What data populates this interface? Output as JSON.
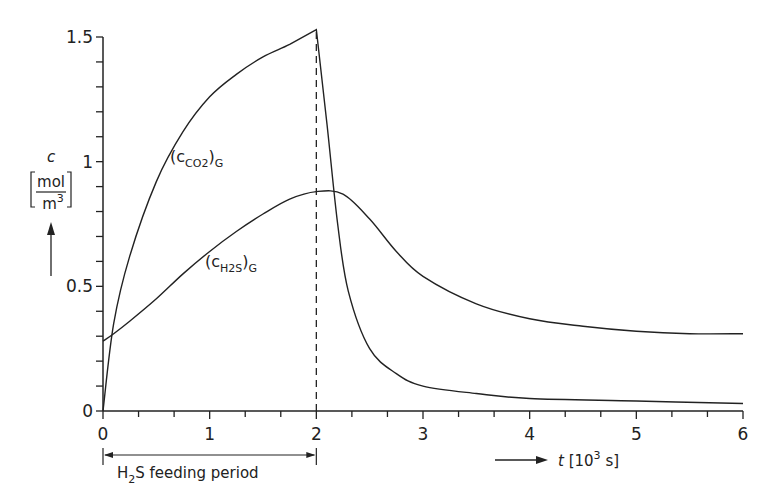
{
  "chart_data": {
    "type": "line",
    "title": "",
    "xlabel": "t [10^3 s]",
    "ylabel": "c [mol/m^3]",
    "xlim": [
      0,
      6
    ],
    "ylim": [
      0,
      1.5
    ],
    "grid": false,
    "legend": "inline labels",
    "x_ticks": [
      "0",
      "1",
      "2",
      "3",
      "4",
      "5",
      "6"
    ],
    "y_ticks": [
      "0",
      "0.5",
      "1",
      "1.5"
    ],
    "series": [
      {
        "name": "(c_CO2)_G",
        "x": [
          0,
          0.1,
          0.25,
          0.5,
          0.75,
          1.0,
          1.25,
          1.5,
          1.75,
          2.0,
          2.1,
          2.2,
          2.3,
          2.5,
          2.75,
          3.0,
          3.5,
          4.0,
          5.0,
          6.0
        ],
        "values": [
          0,
          0.35,
          0.62,
          0.92,
          1.12,
          1.26,
          1.35,
          1.42,
          1.47,
          1.53,
          1.15,
          0.75,
          0.48,
          0.25,
          0.15,
          0.1,
          0.07,
          0.05,
          0.04,
          0.03
        ]
      },
      {
        "name": "(c_H2S)_G",
        "x": [
          0,
          0.1,
          0.25,
          0.5,
          0.75,
          1.0,
          1.25,
          1.5,
          1.75,
          2.0,
          2.25,
          2.5,
          2.75,
          3.0,
          3.5,
          4.0,
          4.5,
          5.0,
          5.5,
          6.0
        ],
        "values": [
          0.28,
          0.31,
          0.36,
          0.45,
          0.55,
          0.64,
          0.72,
          0.79,
          0.85,
          0.88,
          0.87,
          0.77,
          0.64,
          0.54,
          0.43,
          0.37,
          0.34,
          0.32,
          0.31,
          0.31
        ]
      }
    ],
    "annotations": {
      "curve_label_co2": "(c",
      "curve_label_co2_sub": "CO2",
      "curve_label_h2s": "(c",
      "curve_label_h2s_sub": "H2S",
      "curve_label_suffix": ")",
      "curve_label_phase": "G",
      "feeding_period": "H2S feeding period",
      "feeding_period_range": [
        0,
        2
      ],
      "vline_x": 2
    },
    "axis_text": {
      "y_symbol": "c",
      "y_unit_num": "mol",
      "y_unit_den": "m3",
      "x_symbol": "t",
      "x_unit": "[10",
      "x_unit_exp": "3",
      "x_unit_end": " s]"
    }
  }
}
